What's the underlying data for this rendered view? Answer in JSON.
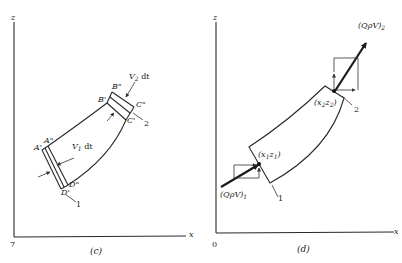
{
  "panel_c": {
    "caption": "(c)",
    "axis_z": "z",
    "axis_x": "x",
    "origin": "7",
    "labels": {
      "A_prime": "A'",
      "A_dprime": "A\"",
      "B_prime": "B'",
      "B_dprime": "B\"",
      "C_prime": "C'",
      "C_dprime": "C\"",
      "D_prime": "D'",
      "D_dprime": "D\"",
      "v1": "V",
      "v1_sub": "1",
      "v1_dt": " dt",
      "v2": "V",
      "v2_sub": "2",
      "v2_dt": " dt",
      "section1": "1",
      "section2": "2"
    }
  },
  "panel_d": {
    "caption": "(d)",
    "axis_z": "z",
    "axis_x": "x",
    "origin": "0",
    "labels": {
      "momentum_in": "(QρV)",
      "momentum_in_sub": "1",
      "momentum_out": "(QρV)",
      "momentum_out_sub": "2",
      "point1": "(x",
      "point1_sub_a": "1",
      "point1_mid": "z",
      "point1_sub_b": "1",
      "point1_end": ")",
      "point2": "(x",
      "point2_sub_a": "2",
      "point2_mid": "z",
      "point2_sub_b": "2",
      "point2_end": ")",
      "section1": "1",
      "section2": "2"
    }
  }
}
